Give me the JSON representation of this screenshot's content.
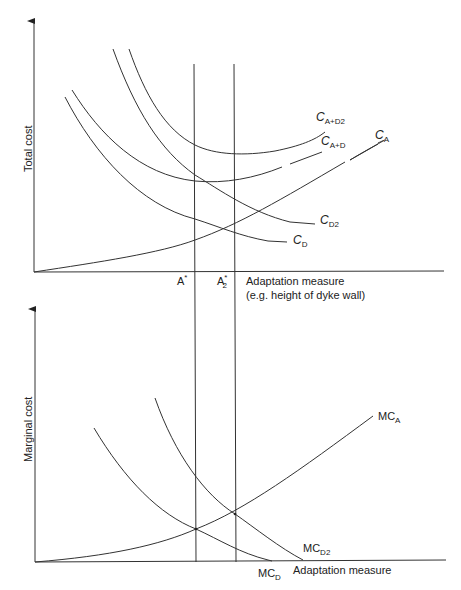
{
  "top_panel": {
    "y_axis_label": "Total cost",
    "x_axis_label_line1": "Adaptation measure",
    "x_axis_label_line2": "(e.g. height of dyke wall)",
    "x_markers": [
      {
        "label": "A",
        "sup": "*",
        "sub": ""
      },
      {
        "label": "A",
        "sup": "*",
        "sub": "2"
      }
    ],
    "curves": [
      {
        "name": "C",
        "sub": "A+D2"
      },
      {
        "name": "C",
        "sub": "A+D"
      },
      {
        "name": "C",
        "sub": "A"
      },
      {
        "name": "C",
        "sub": "D2"
      },
      {
        "name": "C",
        "sub": "D"
      }
    ]
  },
  "bottom_panel": {
    "y_axis_label": "Marginal cost",
    "x_axis_label": "Adaptation measure",
    "curves": [
      {
        "name": "MC",
        "sub": "A"
      },
      {
        "name": "MC",
        "sub": "D2"
      },
      {
        "name": "MC",
        "sub": "D"
      }
    ]
  },
  "colors": {
    "line": "#333333",
    "background": "#ffffff"
  }
}
